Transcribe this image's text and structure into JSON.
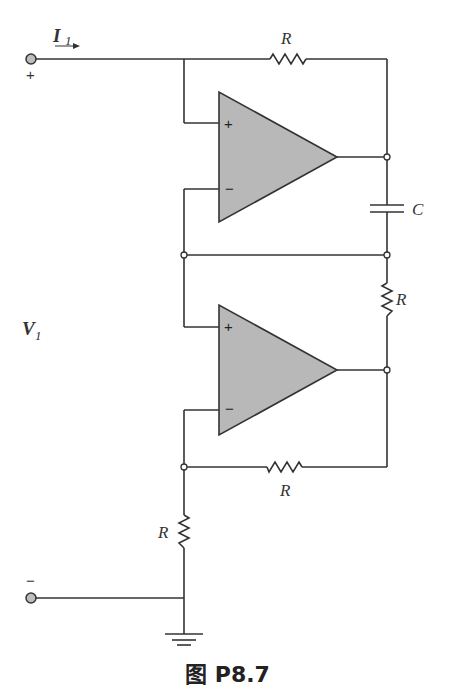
{
  "figure": {
    "caption": "图 P8.7",
    "colors": {
      "wire": "#333333",
      "opamp_fill": "#b8b8b8",
      "terminal_fill": "#bdbdbd"
    }
  },
  "labels": {
    "current": "I",
    "current_sub": "1",
    "voltage": "V",
    "voltage_sub": "1",
    "plus_terminal": "+",
    "minus_terminal": "−",
    "r_top": "R",
    "r_right": "R",
    "r_feedback": "R",
    "r_ground": "R",
    "capacitor": "C",
    "opamp1_plus": "+",
    "opamp1_minus": "−",
    "opamp2_plus": "+",
    "opamp2_minus": "−"
  }
}
